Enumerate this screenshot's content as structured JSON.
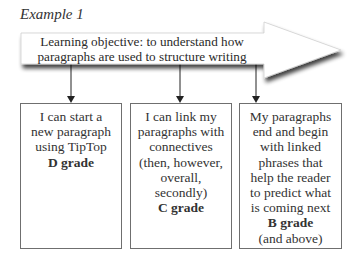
{
  "title": "Example 1",
  "objective": {
    "line1": "Learning objective: to understand how",
    "line2": "paragraphs are used to structure writing"
  },
  "boxes": [
    {
      "lines": [
        "I can start a",
        "new paragraph",
        "using TipTop"
      ],
      "grade": "D grade",
      "extra": ""
    },
    {
      "lines": [
        "I can link my",
        "paragraphs with",
        "connectives",
        "(then, however,",
        "overall,",
        "secondly)"
      ],
      "grade": "C grade",
      "extra": ""
    },
    {
      "lines": [
        "My paragraphs",
        "end and begin",
        "with linked",
        "phrases that",
        "help the reader",
        "to predict what",
        "is coming next"
      ],
      "grade": "B grade",
      "extra": "(and above)"
    }
  ]
}
